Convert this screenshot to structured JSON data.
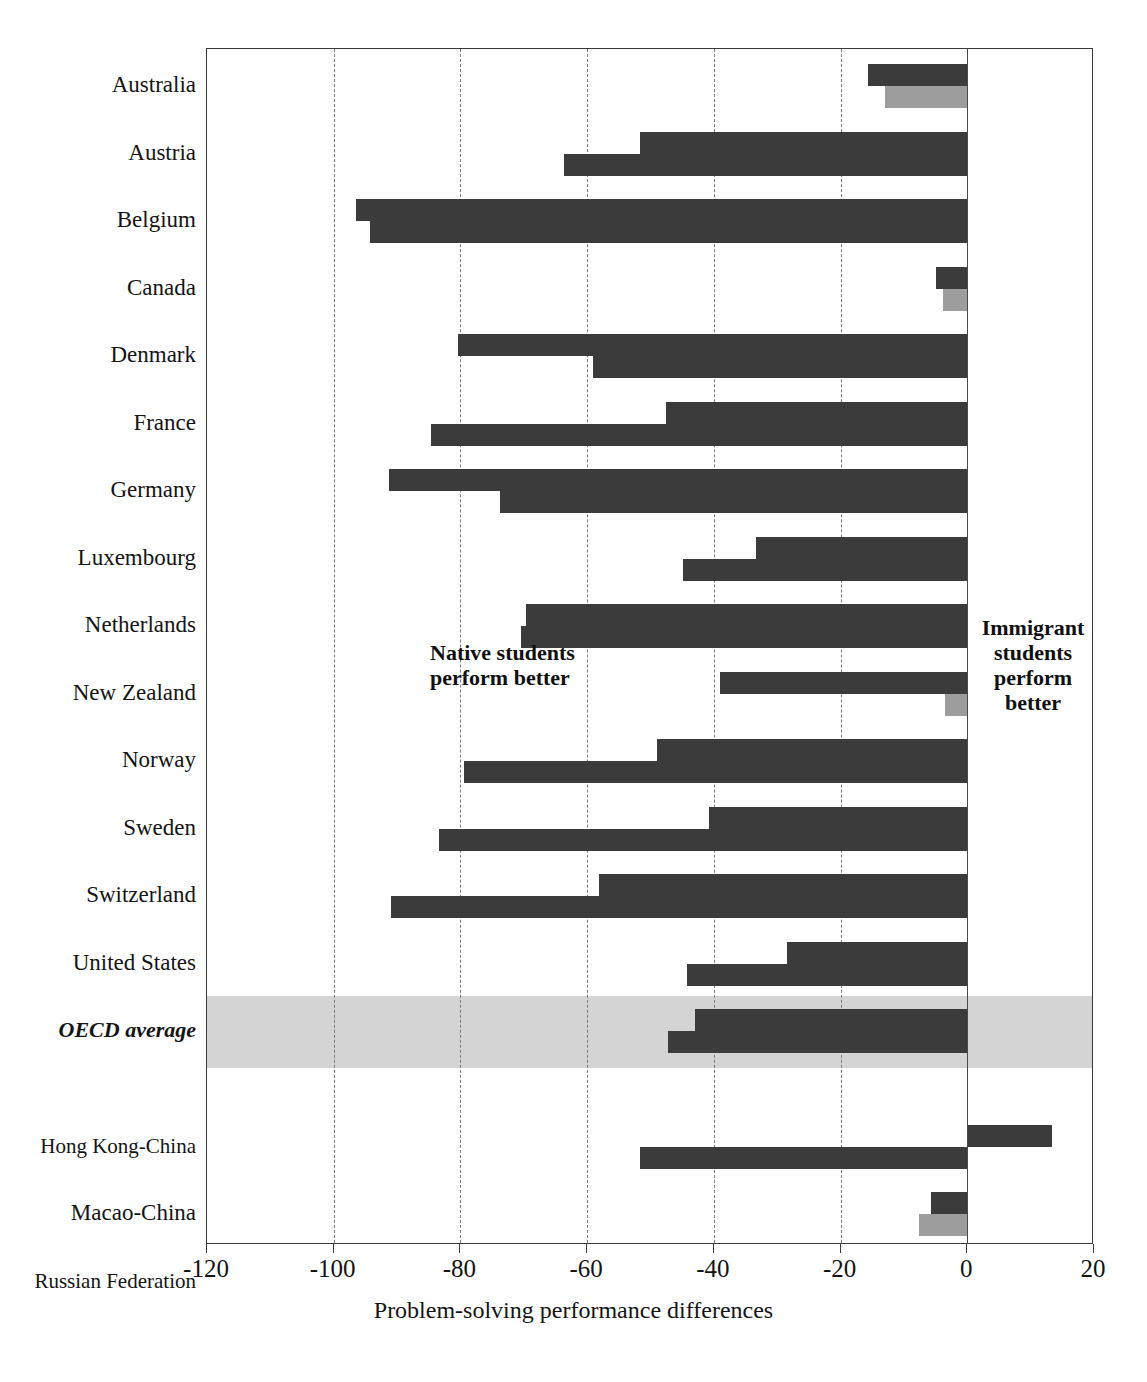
{
  "chart_data": {
    "type": "bar",
    "orientation": "horizontal",
    "title": "",
    "xlabel": "Problem-solving performance differences",
    "ylabel": "",
    "xlim": [
      -120,
      20
    ],
    "xticks": [
      -120,
      -100,
      -80,
      -60,
      -40,
      -20,
      0,
      20
    ],
    "grid": "vertical-dashed",
    "legend_position": "none",
    "annotations": [
      {
        "id": "left-note",
        "text_lines": [
          "Native students",
          "perform better"
        ],
        "x": -85
      },
      {
        "id": "right-note",
        "text_lines": [
          "Immigrant",
          "students",
          "perform",
          "better"
        ],
        "x": 4
      }
    ],
    "series": [
      {
        "name": "series-dark",
        "color": "#3b3b3b"
      },
      {
        "name": "series-light",
        "color": "#9d9d9d"
      }
    ],
    "categories": [
      "Australia",
      "Austria",
      "Belgium",
      "Canada",
      "Denmark",
      "France",
      "Germany",
      "Luxembourg",
      "Netherlands",
      "New Zealand",
      "Norway",
      "Sweden",
      "Switzerland",
      "United States",
      "OECD average",
      "Hong Kong-China",
      "Macao-China",
      "Russian Federation"
    ],
    "rows": [
      {
        "label": "Australia",
        "group": "oecd",
        "highlight": false,
        "top": {
          "value": -15.6,
          "shade": "dark"
        },
        "bottom": {
          "value": -13.0,
          "shade": "light"
        }
      },
      {
        "label": "Austria",
        "group": "oecd",
        "highlight": false,
        "top": {
          "value": -51.6,
          "shade": "dark"
        },
        "bottom": {
          "value": -63.6,
          "shade": "dark"
        }
      },
      {
        "label": "Belgium",
        "group": "oecd",
        "highlight": false,
        "top": {
          "value": -96.5,
          "shade": "dark"
        },
        "bottom": {
          "value": -94.2,
          "shade": "dark"
        }
      },
      {
        "label": "Canada",
        "group": "oecd",
        "highlight": false,
        "top": {
          "value": -5.0,
          "shade": "dark"
        },
        "bottom": {
          "value": -3.8,
          "shade": "light"
        }
      },
      {
        "label": "Denmark",
        "group": "oecd",
        "highlight": false,
        "top": {
          "value": -80.4,
          "shade": "dark"
        },
        "bottom": {
          "value": -59.0,
          "shade": "dark"
        }
      },
      {
        "label": "France",
        "group": "oecd",
        "highlight": false,
        "top": {
          "value": -47.6,
          "shade": "dark"
        },
        "bottom": {
          "value": -84.7,
          "shade": "dark"
        }
      },
      {
        "label": "Germany",
        "group": "oecd",
        "highlight": false,
        "top": {
          "value": -91.3,
          "shade": "dark"
        },
        "bottom": {
          "value": -73.7,
          "shade": "dark"
        }
      },
      {
        "label": "Luxembourg",
        "group": "oecd",
        "highlight": false,
        "top": {
          "value": -33.4,
          "shade": "dark"
        },
        "bottom": {
          "value": -44.8,
          "shade": "dark"
        }
      },
      {
        "label": "Netherlands",
        "group": "oecd",
        "highlight": false,
        "top": {
          "value": -69.7,
          "shade": "dark"
        },
        "bottom": {
          "value": -70.5,
          "shade": "dark"
        }
      },
      {
        "label": "New Zealand",
        "group": "oecd",
        "highlight": false,
        "top": {
          "value": -39.0,
          "shade": "dark"
        },
        "bottom": {
          "value": -3.5,
          "shade": "light"
        }
      },
      {
        "label": "Norway",
        "group": "oecd",
        "highlight": false,
        "top": {
          "value": -48.9,
          "shade": "dark"
        },
        "bottom": {
          "value": -79.5,
          "shade": "dark"
        }
      },
      {
        "label": "Sweden",
        "group": "oecd",
        "highlight": false,
        "top": {
          "value": -40.8,
          "shade": "dark"
        },
        "bottom": {
          "value": -83.4,
          "shade": "dark"
        }
      },
      {
        "label": "Switzerland",
        "group": "oecd",
        "highlight": false,
        "top": {
          "value": -58.2,
          "shade": "dark"
        },
        "bottom": {
          "value": -91.0,
          "shade": "dark"
        }
      },
      {
        "label": "United States",
        "group": "oecd",
        "highlight": false,
        "top": {
          "value": -28.4,
          "shade": "dark"
        },
        "bottom": {
          "value": -44.2,
          "shade": "dark"
        }
      },
      {
        "label": "OECD average",
        "group": "oecd",
        "highlight": true,
        "top": {
          "value": -42.9,
          "shade": "dark"
        },
        "bottom": {
          "value": -47.2,
          "shade": "dark"
        }
      },
      {
        "label": "Hong Kong-China",
        "group": "partner",
        "highlight": false,
        "top": {
          "value": 13.4,
          "shade": "dark"
        },
        "bottom": {
          "value": -51.6,
          "shade": "dark"
        }
      },
      {
        "label": "Macao-China",
        "group": "partner",
        "highlight": false,
        "top": {
          "value": -5.8,
          "shade": "dark"
        },
        "bottom": {
          "value": -7.7,
          "shade": "light"
        }
      },
      {
        "label": "Russian Federation",
        "group": "partner",
        "highlight": false,
        "top": {
          "value": -11.0,
          "shade": "dark"
        },
        "bottom": {
          "value": -31.5,
          "shade": "dark"
        }
      }
    ]
  },
  "axis": {
    "title": "Problem-solving performance differences",
    "ticks": [
      "-120",
      "-100",
      "-80",
      "-60",
      "-40",
      "-20",
      "0",
      "20"
    ]
  },
  "notes": {
    "left_line1": "Native students",
    "left_line2": "perform better",
    "right_line1": "Immigrant",
    "right_line2": "students",
    "right_line3": "perform",
    "right_line4": "better"
  },
  "colors": {
    "bar_dark": "#3b3b3b",
    "bar_light": "#9d9d9d",
    "highlight_band": "#d4d4d4",
    "grid": "#7a7a7a",
    "frame": "#3a3a3a"
  }
}
